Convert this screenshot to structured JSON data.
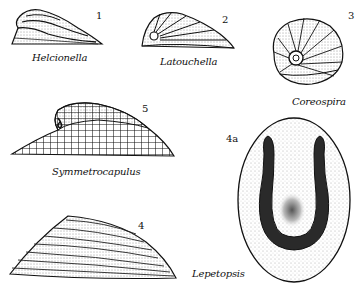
{
  "figure": {
    "specimens": [
      {
        "number": "1",
        "name": "Helcionella"
      },
      {
        "number": "2",
        "name": "Latouchella"
      },
      {
        "number": "3",
        "name": "Coreospira"
      },
      {
        "number": "5",
        "name": "Symmetrocapulus"
      },
      {
        "number": "4",
        "name": ""
      },
      {
        "number": "4a",
        "name": "Lepetopsis"
      }
    ]
  }
}
